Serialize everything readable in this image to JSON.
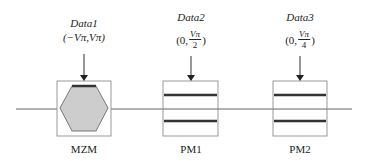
{
  "diagram": {
    "line_color": "#555555",
    "box_border": "#888888",
    "hex_fill": "#cccccc",
    "blocks": [
      {
        "id": "mzm",
        "name": "MZM",
        "data_label": "Data1",
        "param_text": "(−Vπ,Vπ)"
      },
      {
        "id": "pm1",
        "name": "PM1",
        "data_label": "Data2",
        "param_open": "(0,",
        "param_num": "Vπ",
        "param_den": "2",
        "param_close": ")"
      },
      {
        "id": "pm2",
        "name": "PM2",
        "data_label": "Data3",
        "param_open": "(0,",
        "param_num": "Vπ",
        "param_den": "4",
        "param_close": ")"
      }
    ]
  }
}
